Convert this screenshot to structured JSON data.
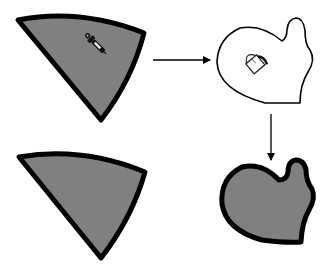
{
  "diagram": {
    "colors": {
      "fill_gray": "#808080",
      "stroke": "#000000",
      "background": "#ffffff",
      "empty_fill": "#ffffff"
    },
    "nodes": [
      {
        "id": "source-wedge",
        "label": "",
        "state": "filled",
        "tool_icon": "eyedropper-icon"
      },
      {
        "id": "target-mitten-outline",
        "label": "",
        "state": "outline",
        "tool_icon": "paint-bucket-icon"
      },
      {
        "id": "result-wedge",
        "label": "",
        "state": "filled"
      },
      {
        "id": "result-mitten-filled",
        "label": "",
        "state": "filled"
      }
    ],
    "edges": [
      {
        "from": "source-wedge",
        "to": "target-mitten-outline",
        "direction": "right"
      },
      {
        "from": "target-mitten-outline",
        "to": "result-mitten-filled",
        "direction": "down"
      }
    ]
  }
}
